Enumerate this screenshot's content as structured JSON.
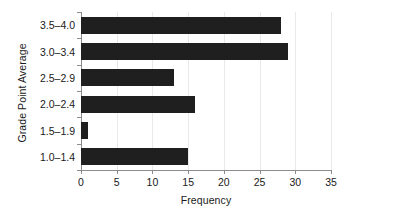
{
  "chart_data": {
    "type": "bar",
    "orientation": "horizontal",
    "title": "",
    "xlabel": "Frequency",
    "ylabel": "Grade Point Average",
    "categories": [
      "1.0–1.4",
      "1.5–1.9",
      "2.0–2.4",
      "2.5–2.9",
      "3.0–3.4",
      "3.5–4.0"
    ],
    "values": [
      15,
      1,
      16,
      13,
      29,
      28
    ],
    "xlim": [
      0,
      35
    ],
    "xticks": [
      0,
      5,
      10,
      15,
      20,
      25,
      30,
      35
    ],
    "xticklabels": [
      "0",
      "5",
      "10",
      "15",
      "20",
      "25",
      "30",
      "35"
    ],
    "grid": "vertical",
    "legend": "none",
    "bar_color": "#1f1f1f",
    "axis_color": "#8c8c8c",
    "gridline_color": "#e9e9e9",
    "background_color": "#ffffff"
  }
}
